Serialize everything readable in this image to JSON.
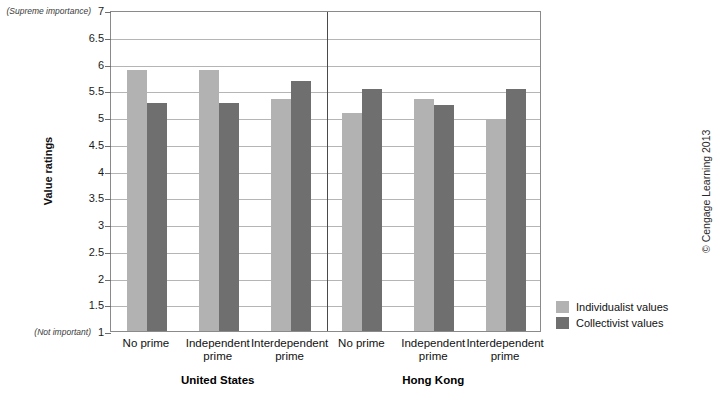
{
  "chart_data": {
    "type": "bar",
    "title": "",
    "xlabel": "",
    "ylabel": "Value ratings",
    "ylim": [
      1,
      7
    ],
    "ytick_step": 0.5,
    "yticks": [
      "7",
      "6.5",
      "6",
      "5.5",
      "5",
      "4.5",
      "4",
      "3.5",
      "3",
      "2.5",
      "2",
      "1.5",
      "1"
    ],
    "y_axis_top_note": "(Supreme importance)",
    "y_axis_bottom_note": "(Not important)",
    "grid": true,
    "legend_position": "right",
    "groups": [
      {
        "name": "United States",
        "categories": [
          "No prime",
          "Independent\nprime",
          "Interdependent\nprime"
        ],
        "series": [
          {
            "name": "Individualist values",
            "values": [
              5.88,
              5.88,
              5.33
            ]
          },
          {
            "name": "Collectivist values",
            "values": [
              5.26,
              5.26,
              5.67
            ]
          }
        ]
      },
      {
        "name": "Hong Kong",
        "categories": [
          "No prime",
          "Independent\nprime",
          "Interdependent\nprime"
        ],
        "series": [
          {
            "name": "Individualist values",
            "values": [
              5.08,
              5.33,
              4.97
            ]
          },
          {
            "name": "Collectivist values",
            "values": [
              5.52,
              5.22,
              5.52
            ]
          }
        ]
      }
    ],
    "series_colors": {
      "Individualist values": "#b2b2b2",
      "Collectivist values": "#6f6f6f"
    }
  },
  "legend": {
    "items": [
      {
        "label": "Individualist values"
      },
      {
        "label": "Collectivist values"
      }
    ]
  },
  "credit": "© Cengage Learning 2013"
}
